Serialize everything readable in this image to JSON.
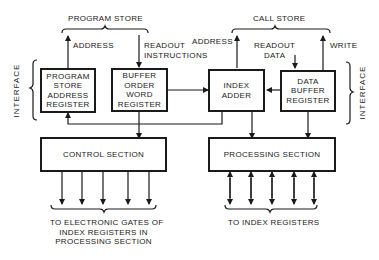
{
  "diagram": {
    "stores": {
      "program_store": "PROGRAM STORE",
      "call_store": "CALL STORE"
    },
    "signals": {
      "address_left": "ADDRESS",
      "readout_instructions": "READOUT\nINSTRUCTIONS",
      "address_right": "ADDRESS",
      "readout_data": "READOUT\nDATA",
      "write": "WRITE"
    },
    "interface_left": "INTERFACE",
    "interface_right": "INTERFACE",
    "blocks": {
      "program_store_address_register": "PROGRAM\nSTORE\nADDRESS\nREGISTER",
      "buffer_order_word_register": "BUFFER\nORDER\nWORD\nREGISTER",
      "index_adder": "INDEX\nADDER",
      "data_buffer_register": "DATA\nBUFFER\nREGISTER",
      "control_section": "CONTROL SECTION",
      "processing_section": "PROCESSING SECTION"
    },
    "outputs": {
      "control": "TO ELECTRONIC GATES OF\nINDEX REGISTERS IN\nPROCESSING SECTION",
      "processing": "TO INDEX REGISTERS"
    }
  }
}
